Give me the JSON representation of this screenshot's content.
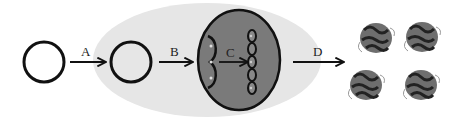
{
  "diagram": {
    "type": "process-flow",
    "steps": [
      {
        "id": "A",
        "label": "A",
        "from": "plasmid-1",
        "to": "plasmid-2"
      },
      {
        "id": "B",
        "label": "B",
        "from": "plasmid-2",
        "to": "cell-nucleus"
      },
      {
        "id": "C",
        "label": "C",
        "from": "dna-fragment",
        "to": "chromosome"
      },
      {
        "id": "D",
        "label": "D",
        "from": "host-cell",
        "to": "proteins"
      }
    ],
    "nodes": [
      {
        "id": "plasmid-1",
        "shape": "circle"
      },
      {
        "id": "plasmid-2",
        "shape": "circle"
      },
      {
        "id": "host-cell",
        "shape": "ellipse",
        "color": "#e6e6e6"
      },
      {
        "id": "cell-nucleus",
        "shape": "ellipse",
        "color": "#7a7a7a"
      },
      {
        "id": "proteins",
        "shape": "protein-structures",
        "count": 4
      }
    ],
    "colors": {
      "stroke": "#111111",
      "host_cell": "#e6e6e6",
      "nucleus": "#7a7a7a",
      "background": "#ffffff"
    }
  },
  "labels": {
    "a": "A",
    "b": "B",
    "c": "C",
    "d": "D"
  }
}
